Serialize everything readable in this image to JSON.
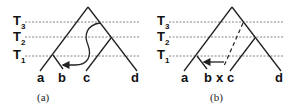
{
  "figure": {
    "panels": [
      {
        "id": "a",
        "caption": "(a)",
        "time_labels": [
          {
            "main": "T",
            "sub": "3"
          },
          {
            "main": "T",
            "sub": "2"
          },
          {
            "main": "T",
            "sub": "1"
          }
        ],
        "leaves": [
          "a",
          "b",
          "c",
          "d"
        ],
        "transfer": "solid curved arrow from T3 on branch to c/d lineage down to leaf b branch"
      },
      {
        "id": "b",
        "caption": "(b)",
        "time_labels": [
          {
            "main": "T",
            "sub": "3"
          },
          {
            "main": "T",
            "sub": "2"
          },
          {
            "main": "T",
            "sub": "1"
          }
        ],
        "leaves": [
          "a",
          "b",
          "x",
          "c",
          "d"
        ],
        "transfer": "dashed ghost lineage x from T3 with horizontal arrow to b branch at T1"
      }
    ]
  }
}
